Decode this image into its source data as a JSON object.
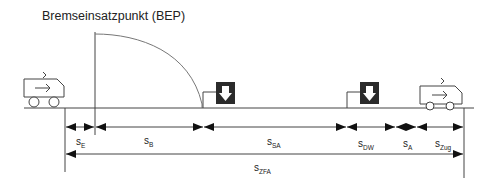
{
  "title": "Bremseinsatzpunkt (BEP)",
  "distances": [
    {
      "id": "sE",
      "base": "s",
      "sub": "E",
      "label": "sE"
    },
    {
      "id": "sB",
      "base": "s",
      "sub": "B",
      "label": "sB"
    },
    {
      "id": "sSA",
      "base": "s",
      "sub": "SA",
      "label": "sSA"
    },
    {
      "id": "sDW",
      "base": "s",
      "sub": "DW",
      "label": "sDW"
    },
    {
      "id": "sA",
      "base": "s",
      "sub": "A",
      "label": "sA"
    },
    {
      "id": "sZug",
      "base": "s",
      "sub": "Zug",
      "label": "sZug"
    },
    {
      "id": "sZFA",
      "base": "s",
      "sub": "ZFA",
      "label": "sZFA"
    }
  ],
  "icons": {
    "train_left": "train-icon",
    "train_right": "train-icon",
    "signal_1": "signal-down-arrow-icon",
    "signal_2": "signal-down-arrow-icon"
  },
  "colors": {
    "line": "#333333",
    "curve": "#777777",
    "signal_box": "#2b2b2b"
  }
}
